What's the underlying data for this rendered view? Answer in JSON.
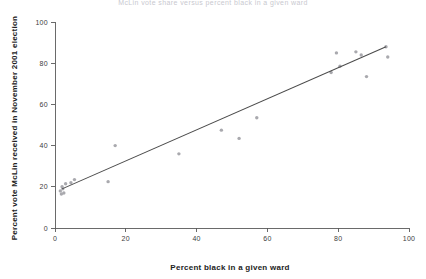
{
  "figure": {
    "title_partial": "McLin vote share versus percent black in a given ward",
    "background_color": "#ffffff",
    "axis_color": "#5a5a5a",
    "marker_color": "#a9a9ae",
    "line_color": "#4a4a4a"
  },
  "chart_data": {
    "type": "scatter",
    "title": "McLin vote share versus percent black in a given ward",
    "xlabel": "Percent black in a given ward",
    "ylabel": "Percent vote McLin received in November 2001 election",
    "xlim": [
      0,
      100
    ],
    "ylim": [
      0,
      100
    ],
    "xticks": [
      0,
      20,
      40,
      60,
      80,
      100
    ],
    "yticks": [
      0,
      20,
      40,
      60,
      80,
      100
    ],
    "xtick_labels": [
      "0",
      "20",
      "40",
      "60",
      "80",
      "100"
    ],
    "ytick_labels": [
      "0",
      "20",
      "40",
      "60",
      "80",
      "100"
    ],
    "grid": false,
    "legend": false,
    "points": [
      {
        "x": 1.5,
        "y": 18.0
      },
      {
        "x": 1.8,
        "y": 16.5
      },
      {
        "x": 2.0,
        "y": 20.0
      },
      {
        "x": 2.2,
        "y": 19.0
      },
      {
        "x": 2.5,
        "y": 17.0
      },
      {
        "x": 3.0,
        "y": 21.5
      },
      {
        "x": 4.5,
        "y": 22.0
      },
      {
        "x": 5.5,
        "y": 23.5
      },
      {
        "x": 15.0,
        "y": 22.5
      },
      {
        "x": 17.0,
        "y": 40.0
      },
      {
        "x": 35.0,
        "y": 36.0
      },
      {
        "x": 47.0,
        "y": 47.5
      },
      {
        "x": 52.0,
        "y": 43.5
      },
      {
        "x": 57.0,
        "y": 53.5
      },
      {
        "x": 78.0,
        "y": 75.5
      },
      {
        "x": 79.5,
        "y": 85.0
      },
      {
        "x": 80.5,
        "y": 78.5
      },
      {
        "x": 85.0,
        "y": 85.5
      },
      {
        "x": 86.5,
        "y": 84.0
      },
      {
        "x": 88.0,
        "y": 73.5
      },
      {
        "x": 93.5,
        "y": 88.0
      },
      {
        "x": 94.0,
        "y": 83.0
      }
    ],
    "trend_line": {
      "type": "linear-fit",
      "x_start": 2.0,
      "y_start": 19.0,
      "x_end": 93.5,
      "y_end": 88.0
    }
  }
}
